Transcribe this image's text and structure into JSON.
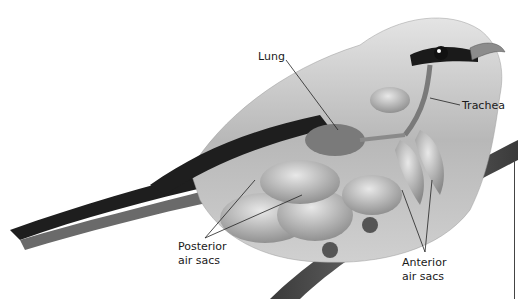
{
  "diagram": {
    "labels": {
      "lung": "Lung",
      "trachea": "Trachea",
      "posterior_air_sacs": [
        "Posterior",
        "air sacs"
      ],
      "anterior_air_sacs": [
        "Anterior",
        "air sacs"
      ]
    },
    "colors": {
      "background": "#ffffff",
      "body": "#bdbdbd",
      "wing_dark": "#1e1e1e",
      "organs": "#9a9a9a",
      "branch": "#4a4a4a",
      "label_text": "#1a1a1a",
      "leader_line": "#222222"
    }
  }
}
